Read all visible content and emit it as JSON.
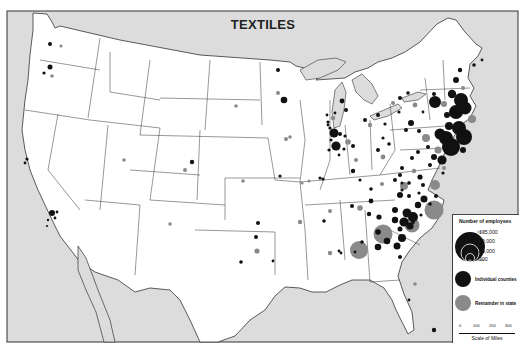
{
  "title": "TEXTILES",
  "legend": {
    "heading": "Number of employees",
    "sizes": [
      "135,000",
      "50,000",
      "10,000",
      "500"
    ],
    "categories": [
      {
        "label": "Individual counties",
        "color": "#111111"
      },
      {
        "label": "Remainder in state",
        "color": "#8a8a8a"
      }
    ],
    "scale": {
      "ticks": [
        "0",
        "100",
        "200",
        "300"
      ],
      "caption": "Scale of Miles"
    }
  },
  "colors": {
    "water": "#dcdcdc",
    "land": "#ffffff",
    "border": "#333333",
    "county": "#111111",
    "state_remainder": "#8a8a8a"
  },
  "chart_data": {
    "type": "proportional-symbol-map",
    "title": "TEXTILES",
    "legend_title": "Number of employees",
    "size_reference": [
      135000,
      50000,
      10000,
      500
    ],
    "series": [
      {
        "name": "Individual counties",
        "color": "#111111"
      },
      {
        "name": "Remainder in state",
        "color": "#8a8a8a"
      }
    ],
    "regions_heavy": [
      "New England",
      "New York",
      "Pennsylvania",
      "New Jersey",
      "North Carolina",
      "South Carolina",
      "Georgia",
      "Virginia"
    ],
    "scale_miles": [
      0,
      100,
      200,
      300
    ]
  },
  "symbols": [
    {
      "x": 50,
      "y": 44,
      "r": 2,
      "t": "c"
    },
    {
      "x": 61,
      "y": 46,
      "r": 1.6,
      "t": "s"
    },
    {
      "x": 50,
      "y": 67,
      "r": 2.5,
      "t": "c"
    },
    {
      "x": 44,
      "y": 73,
      "r": 1.6,
      "t": "c"
    },
    {
      "x": 52,
      "y": 76,
      "r": 1.8,
      "t": "s"
    },
    {
      "x": 27,
      "y": 159,
      "r": 1.6,
      "t": "c"
    },
    {
      "x": 25,
      "y": 163,
      "r": 1.4,
      "t": "c"
    },
    {
      "x": 52,
      "y": 213,
      "r": 3,
      "t": "c"
    },
    {
      "x": 57,
      "y": 212,
      "r": 1.4,
      "t": "c"
    },
    {
      "x": 55,
      "y": 218,
      "r": 1.4,
      "t": "c"
    },
    {
      "x": 48,
      "y": 220,
      "r": 1.2,
      "t": "c"
    },
    {
      "x": 47,
      "y": 226,
      "r": 1.1,
      "t": "c"
    },
    {
      "x": 124,
      "y": 160,
      "r": 1.8,
      "t": "s"
    },
    {
      "x": 170,
      "y": 224,
      "r": 1.8,
      "t": "s"
    },
    {
      "x": 192,
      "y": 162,
      "r": 2.2,
      "t": "c"
    },
    {
      "x": 185,
      "y": 170,
      "r": 2,
      "t": "s"
    },
    {
      "x": 236,
      "y": 106,
      "r": 1.8,
      "t": "s"
    },
    {
      "x": 243,
      "y": 181,
      "r": 1.8,
      "t": "s"
    },
    {
      "x": 278,
      "y": 70,
      "r": 2,
      "t": "c"
    },
    {
      "x": 278,
      "y": 93,
      "r": 2,
      "t": "s"
    },
    {
      "x": 284,
      "y": 100,
      "r": 3.3,
      "t": "c"
    },
    {
      "x": 286,
      "y": 139,
      "r": 2,
      "t": "s"
    },
    {
      "x": 290,
      "y": 137,
      "r": 1.8,
      "t": "s"
    },
    {
      "x": 280,
      "y": 176,
      "r": 1.6,
      "t": "c"
    },
    {
      "x": 302,
      "y": 183,
      "r": 1.6,
      "t": "s"
    },
    {
      "x": 258,
      "y": 223,
      "r": 2,
      "t": "c"
    },
    {
      "x": 256,
      "y": 237,
      "r": 2,
      "t": "c"
    },
    {
      "x": 257,
      "y": 251,
      "r": 2.6,
      "t": "s"
    },
    {
      "x": 241,
      "y": 262,
      "r": 1.8,
      "t": "c"
    },
    {
      "x": 273,
      "y": 261,
      "r": 1.4,
      "t": "c"
    },
    {
      "x": 300,
      "y": 222,
      "r": 2.2,
      "t": "s"
    },
    {
      "x": 324,
      "y": 221,
      "r": 1.8,
      "t": "c"
    },
    {
      "x": 330,
      "y": 211,
      "r": 2,
      "t": "s"
    },
    {
      "x": 330,
      "y": 253,
      "r": 2.2,
      "t": "s"
    },
    {
      "x": 339,
      "y": 251,
      "r": 1.4,
      "t": "c"
    },
    {
      "x": 323,
      "y": 179,
      "r": 1.6,
      "t": "c"
    },
    {
      "x": 320,
      "y": 178,
      "r": 1.6,
      "t": "c"
    },
    {
      "x": 309,
      "y": 181,
      "r": 1.6,
      "t": "s"
    },
    {
      "x": 328,
      "y": 122,
      "r": 1.6,
      "t": "c"
    },
    {
      "x": 330,
      "y": 128,
      "r": 1.6,
      "t": "c"
    },
    {
      "x": 333,
      "y": 118,
      "r": 2.2,
      "t": "s"
    },
    {
      "x": 334,
      "y": 133,
      "r": 4.5,
      "t": "c"
    },
    {
      "x": 340,
      "y": 134,
      "r": 2,
      "t": "c"
    },
    {
      "x": 331,
      "y": 140,
      "r": 1.6,
      "t": "c"
    },
    {
      "x": 345,
      "y": 136,
      "r": 1.6,
      "t": "c"
    },
    {
      "x": 336,
      "y": 146,
      "r": 4.6,
      "t": "c"
    },
    {
      "x": 329,
      "y": 150,
      "r": 1.6,
      "t": "c"
    },
    {
      "x": 344,
      "y": 149,
      "r": 1.6,
      "t": "c"
    },
    {
      "x": 339,
      "y": 155,
      "r": 1.4,
      "t": "c"
    },
    {
      "x": 328,
      "y": 125,
      "r": 1.4,
      "t": "c"
    },
    {
      "x": 335,
      "y": 113,
      "r": 1.4,
      "t": "c"
    },
    {
      "x": 327,
      "y": 115,
      "r": 1.4,
      "t": "c"
    },
    {
      "x": 346,
      "y": 110,
      "r": 2,
      "t": "c"
    },
    {
      "x": 342,
      "y": 101,
      "r": 2.4,
      "t": "c"
    },
    {
      "x": 348,
      "y": 142,
      "r": 2.8,
      "t": "s"
    },
    {
      "x": 353,
      "y": 146,
      "r": 2,
      "t": "c"
    },
    {
      "x": 356,
      "y": 160,
      "r": 2,
      "t": "s"
    },
    {
      "x": 353,
      "y": 171,
      "r": 2.2,
      "t": "c"
    },
    {
      "x": 360,
      "y": 180,
      "r": 1.6,
      "t": "c"
    },
    {
      "x": 365,
      "y": 120,
      "r": 2,
      "t": "c"
    },
    {
      "x": 370,
      "y": 125,
      "r": 2.2,
      "t": "s"
    },
    {
      "x": 378,
      "y": 115,
      "r": 2,
      "t": "c"
    },
    {
      "x": 385,
      "y": 124,
      "r": 1.6,
      "t": "c"
    },
    {
      "x": 383,
      "y": 138,
      "r": 1.6,
      "t": "c"
    },
    {
      "x": 378,
      "y": 150,
      "r": 2,
      "t": "c"
    },
    {
      "x": 383,
      "y": 157,
      "r": 2.4,
      "t": "s"
    },
    {
      "x": 389,
      "y": 144,
      "r": 1.8,
      "t": "c"
    },
    {
      "x": 400,
      "y": 98,
      "r": 2,
      "t": "c"
    },
    {
      "x": 408,
      "y": 93,
      "r": 1.8,
      "t": "c"
    },
    {
      "x": 393,
      "y": 103,
      "r": 2,
      "t": "s"
    },
    {
      "x": 415,
      "y": 105,
      "r": 2.4,
      "t": "s"
    },
    {
      "x": 399,
      "y": 112,
      "r": 1.6,
      "t": "c"
    },
    {
      "x": 423,
      "y": 112,
      "r": 1.4,
      "t": "c"
    },
    {
      "x": 426,
      "y": 138,
      "r": 4,
      "t": "s"
    },
    {
      "x": 428,
      "y": 147,
      "r": 2,
      "t": "c"
    },
    {
      "x": 418,
      "y": 152,
      "r": 2,
      "t": "c"
    },
    {
      "x": 412,
      "y": 158,
      "r": 2,
      "t": "c"
    },
    {
      "x": 411,
      "y": 123,
      "r": 3,
      "t": "c"
    },
    {
      "x": 419,
      "y": 131,
      "r": 2,
      "t": "c"
    },
    {
      "x": 406,
      "y": 130,
      "r": 2,
      "t": "c"
    },
    {
      "x": 402,
      "y": 168,
      "r": 2,
      "t": "c"
    },
    {
      "x": 414,
      "y": 171,
      "r": 2.2,
      "t": "s"
    },
    {
      "x": 420,
      "y": 177,
      "r": 2.6,
      "t": "c"
    },
    {
      "x": 423,
      "y": 185,
      "r": 2,
      "t": "c"
    },
    {
      "x": 409,
      "y": 183,
      "r": 1.8,
      "t": "c"
    },
    {
      "x": 402,
      "y": 190,
      "r": 1.6,
      "t": "c"
    },
    {
      "x": 409,
      "y": 196,
      "r": 2,
      "t": "c"
    },
    {
      "x": 430,
      "y": 165,
      "r": 2,
      "t": "c"
    },
    {
      "x": 443,
      "y": 173,
      "r": 1.6,
      "t": "c"
    },
    {
      "x": 451,
      "y": 147,
      "r": 9,
      "t": "c"
    },
    {
      "x": 449,
      "y": 126,
      "r": 4,
      "t": "c"
    },
    {
      "x": 447,
      "y": 115,
      "r": 3,
      "t": "c"
    },
    {
      "x": 452,
      "y": 94,
      "r": 4.2,
      "t": "c"
    },
    {
      "x": 456,
      "y": 80,
      "r": 3,
      "t": "c"
    },
    {
      "x": 460,
      "y": 70,
      "r": 2.2,
      "t": "c"
    },
    {
      "x": 461,
      "y": 100,
      "r": 7,
      "t": "c"
    },
    {
      "x": 456,
      "y": 112,
      "r": 7,
      "t": "c"
    },
    {
      "x": 465,
      "y": 108,
      "r": 6.5,
      "t": "c"
    },
    {
      "x": 472,
      "y": 119,
      "r": 4,
      "t": "s"
    },
    {
      "x": 444,
      "y": 104,
      "r": 3,
      "t": "s"
    },
    {
      "x": 459,
      "y": 128,
      "r": 7,
      "t": "c"
    },
    {
      "x": 464,
      "y": 137,
      "r": 8,
      "t": "c"
    },
    {
      "x": 463,
      "y": 150,
      "r": 3,
      "t": "c"
    },
    {
      "x": 474,
      "y": 65,
      "r": 1.8,
      "t": "c"
    },
    {
      "x": 482,
      "y": 60,
      "r": 1.4,
      "t": "c"
    },
    {
      "x": 463,
      "y": 88,
      "r": 2,
      "t": "s"
    },
    {
      "x": 435,
      "y": 102,
      "r": 6,
      "t": "c"
    },
    {
      "x": 434,
      "y": 94,
      "r": 2,
      "t": "c"
    },
    {
      "x": 440,
      "y": 134,
      "r": 5.5,
      "t": "c"
    },
    {
      "x": 446,
      "y": 138,
      "r": 7,
      "t": "c"
    },
    {
      "x": 438,
      "y": 150,
      "r": 3.5,
      "t": "s"
    },
    {
      "x": 442,
      "y": 160,
      "r": 4.6,
      "t": "c"
    },
    {
      "x": 434,
      "y": 157,
      "r": 3,
      "t": "c"
    },
    {
      "x": 444,
      "y": 168,
      "r": 2,
      "t": "s"
    },
    {
      "x": 435,
      "y": 185,
      "r": 5,
      "t": "s"
    },
    {
      "x": 436,
      "y": 196,
      "r": 2,
      "t": "c"
    },
    {
      "x": 430,
      "y": 204,
      "r": 1.8,
      "t": "c"
    },
    {
      "x": 434,
      "y": 210,
      "r": 9.5,
      "t": "s"
    },
    {
      "x": 418,
      "y": 205,
      "r": 3.2,
      "t": "c"
    },
    {
      "x": 424,
      "y": 199,
      "r": 3.5,
      "t": "c"
    },
    {
      "x": 421,
      "y": 215,
      "r": 1.6,
      "t": "c"
    },
    {
      "x": 419,
      "y": 193,
      "r": 1.6,
      "t": "c"
    },
    {
      "x": 402,
      "y": 183,
      "r": 1.6,
      "t": "c"
    },
    {
      "x": 413,
      "y": 217,
      "r": 5,
      "t": "c"
    },
    {
      "x": 407,
      "y": 213,
      "r": 4.5,
      "t": "c"
    },
    {
      "x": 404,
      "y": 222,
      "r": 4.6,
      "t": "c"
    },
    {
      "x": 395,
      "y": 220,
      "r": 3.2,
      "t": "c"
    },
    {
      "x": 410,
      "y": 226,
      "r": 3.6,
      "t": "c"
    },
    {
      "x": 400,
      "y": 229,
      "r": 2.5,
      "t": "c"
    },
    {
      "x": 402,
      "y": 238,
      "r": 4,
      "t": "c"
    },
    {
      "x": 397,
      "y": 246,
      "r": 3.5,
      "t": "c"
    },
    {
      "x": 395,
      "y": 210,
      "r": 3,
      "t": "c"
    },
    {
      "x": 412,
      "y": 225,
      "r": 7.5,
      "t": "s"
    },
    {
      "x": 413,
      "y": 222,
      "r": 2,
      "t": "c"
    },
    {
      "x": 383,
      "y": 234,
      "r": 9.5,
      "t": "s"
    },
    {
      "x": 378,
      "y": 232,
      "r": 2.8,
      "t": "c"
    },
    {
      "x": 387,
      "y": 241,
      "r": 3.3,
      "t": "c"
    },
    {
      "x": 378,
      "y": 247,
      "r": 3.3,
      "t": "c"
    },
    {
      "x": 400,
      "y": 257,
      "r": 2,
      "t": "c"
    },
    {
      "x": 362,
      "y": 242,
      "r": 1.8,
      "t": "c"
    },
    {
      "x": 355,
      "y": 252,
      "r": 1.4,
      "t": "c"
    },
    {
      "x": 359,
      "y": 250,
      "r": 9,
      "t": "s"
    },
    {
      "x": 341,
      "y": 253,
      "r": 1.4,
      "t": "c"
    },
    {
      "x": 379,
      "y": 217,
      "r": 2.6,
      "t": "c"
    },
    {
      "x": 371,
      "y": 201,
      "r": 2.4,
      "t": "c"
    },
    {
      "x": 360,
      "y": 208,
      "r": 2.8,
      "t": "s"
    },
    {
      "x": 352,
      "y": 206,
      "r": 2,
      "t": "c"
    },
    {
      "x": 369,
      "y": 214,
      "r": 2.2,
      "t": "c"
    },
    {
      "x": 371,
      "y": 189,
      "r": 1.8,
      "t": "c"
    },
    {
      "x": 382,
      "y": 184,
      "r": 2,
      "t": "s"
    },
    {
      "x": 395,
      "y": 180,
      "r": 2,
      "t": "c"
    },
    {
      "x": 400,
      "y": 175,
      "r": 2,
      "t": "c"
    },
    {
      "x": 409,
      "y": 183,
      "r": 1.4,
      "t": "c"
    },
    {
      "x": 400,
      "y": 195,
      "r": 3,
      "t": "c"
    },
    {
      "x": 404,
      "y": 186,
      "r": 4,
      "t": "s"
    },
    {
      "x": 415,
      "y": 284,
      "r": 1.8,
      "t": "s"
    },
    {
      "x": 434,
      "y": 330,
      "r": 2.2,
      "t": "c"
    },
    {
      "x": 409,
      "y": 300,
      "r": 1.4,
      "t": "c"
    }
  ]
}
